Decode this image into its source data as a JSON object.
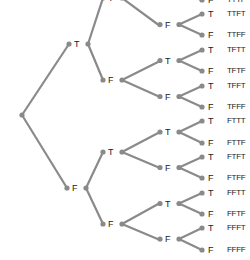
{
  "diagram": {
    "type": "probability-tree",
    "title": "",
    "levels": 4,
    "branch_labels": [
      "T",
      "F"
    ],
    "colors": {
      "edge": "#8a8a8a",
      "node": "#8a8a8a",
      "text": "#222222"
    },
    "root": {
      "x": 22,
      "y": 115
    },
    "level1": [
      {
        "label": "T",
        "x": 69,
        "y": 44,
        "split_x": 88
      },
      {
        "label": "F",
        "x": 67,
        "y": 188,
        "split_x": 86
      }
    ],
    "level2": [
      {
        "label": "T",
        "x": 121,
        "y": -2,
        "split_x": 140,
        "parent": 0
      },
      {
        "label": "F",
        "x": 121,
        "y": 80,
        "split_x": 140,
        "parent": 0
      },
      {
        "label": "T",
        "x": 121,
        "y": 152,
        "split_x": 140,
        "parent": 1
      },
      {
        "label": "F",
        "x": 121,
        "y": 224,
        "split_x": 140,
        "parent": 1
      }
    ],
    "level3": [
      {
        "label": "T",
        "x": 160,
        "y": -19,
        "split_x": 179,
        "parent": 0
      },
      {
        "label": "F",
        "x": 160,
        "y": 26,
        "split_x": 179,
        "parent": 0
      },
      {
        "label": "T",
        "x": 160,
        "y": 61,
        "split_x": 179,
        "parent": 1
      },
      {
        "label": "F",
        "x": 160,
        "y": 97,
        "split_x": 179,
        "parent": 1
      },
      {
        "label": "T",
        "x": 160,
        "y": 132,
        "split_x": 179,
        "parent": 2
      },
      {
        "label": "F",
        "x": 160,
        "y": 168,
        "split_x": 179,
        "parent": 2
      },
      {
        "label": "T",
        "x": 160,
        "y": 203,
        "split_x": 179,
        "parent": 3
      },
      {
        "label": "F",
        "x": 160,
        "y": 240,
        "split_x": 179,
        "parent": 3
      }
    ],
    "leaves": [
      {
        "label": "T",
        "outcome": "TTTT",
        "y": -14
      },
      {
        "label": "F",
        "outcome": "TTTF",
        "y": 0
      },
      {
        "label": "T",
        "outcome": "TTFT",
        "y": 14
      },
      {
        "label": "F",
        "outcome": "TTFF",
        "y": 35
      },
      {
        "label": "T",
        "outcome": "TFTT",
        "y": 50
      },
      {
        "label": "F",
        "outcome": "TFTF",
        "y": 71
      },
      {
        "label": "T",
        "outcome": "TFFT",
        "y": 86
      },
      {
        "label": "F",
        "outcome": "TFFF",
        "y": 107
      },
      {
        "label": "T",
        "outcome": "FTTT",
        "y": 121
      },
      {
        "label": "F",
        "outcome": "FTTF",
        "y": 143
      },
      {
        "label": "T",
        "outcome": "FTFT",
        "y": 157
      },
      {
        "label": "F",
        "outcome": "FTFF",
        "y": 178
      },
      {
        "label": "T",
        "outcome": "FFTT",
        "y": 193
      },
      {
        "label": "F",
        "outcome": "FFTF",
        "y": 214
      },
      {
        "label": "T",
        "outcome": "FFFT",
        "y": 228
      },
      {
        "label": "F",
        "outcome": "FFFF",
        "y": 250
      }
    ],
    "leaf_x": 202,
    "leaf_label_x": 208,
    "outcome_x": 227
  }
}
